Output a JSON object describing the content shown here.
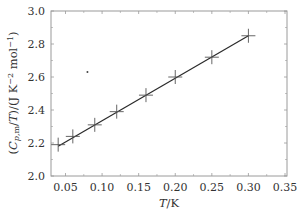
{
  "chart_data": {
    "type": "scatter",
    "title": "",
    "xlabel": "T/K",
    "ylabel": "(C_p,m/T)/(J K^-2 mol^-1)",
    "xlim": [
      0.025,
      0.35
    ],
    "ylim": [
      2.0,
      3.0
    ],
    "grid": false,
    "legend": null,
    "x_ticks": [
      "0.05",
      "0.10",
      "0.15",
      "0.20",
      "0.25",
      "0.30",
      "0.35"
    ],
    "y_ticks": [
      "2.0",
      "2.2",
      "2.4",
      "2.6",
      "2.8",
      "3.0"
    ],
    "series": [
      {
        "name": "data",
        "marker": "+",
        "x": [
          0.04,
          0.06,
          0.09,
          0.12,
          0.16,
          0.2,
          0.25,
          0.3
        ],
        "y": [
          2.19,
          2.24,
          2.31,
          2.39,
          2.49,
          2.6,
          2.72,
          2.85
        ]
      },
      {
        "name": "linear fit",
        "style": "line",
        "x": [
          0.04,
          0.3
        ],
        "y": [
          2.18,
          2.85
        ]
      }
    ],
    "annotations": [
      {
        "type": "stray-dot",
        "x": 0.08,
        "y": 2.63
      }
    ]
  },
  "axes": {
    "x_title_italic": "T",
    "x_title_rest": "/K",
    "y_title": "(Cp,m/T)/(J K⁻² mol⁻¹)"
  },
  "colors": {
    "frame": "#9a9a9a",
    "line": "#2a2a2a",
    "marker": "#555555",
    "text": "#333333"
  }
}
